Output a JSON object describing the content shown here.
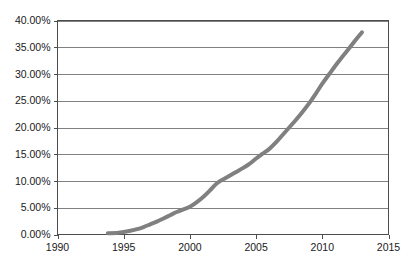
{
  "chart_data": {
    "type": "line",
    "title": "",
    "subtitle": "",
    "xlabel": "",
    "ylabel": "",
    "xlim": [
      1990,
      2015
    ],
    "ylim": [
      0,
      40
    ],
    "grid": "horizontal",
    "legend": "none",
    "line_color": "#808080",
    "axis_color": "#4d4d4d",
    "gridline_color": "#808080",
    "background_color": "#ffffff",
    "x_ticks": [
      1990,
      1995,
      2000,
      2005,
      2010,
      2015
    ],
    "x_tick_labels": [
      "1990",
      "1995",
      "2000",
      "2005",
      "2010",
      "2015"
    ],
    "y_ticks": [
      0,
      5,
      10,
      15,
      20,
      25,
      30,
      35,
      40
    ],
    "y_tick_labels": [
      "0.00%",
      "5.00%",
      "10.00%",
      "15.00%",
      "20.00%",
      "25.00%",
      "30.00%",
      "35.00%",
      "40.00%"
    ],
    "series": [
      {
        "name": "series-1",
        "color": "#808080",
        "x": [
          1993.8,
          1994.5,
          1995,
          1995.5,
          1996,
          1996.5,
          1997,
          1997.5,
          1998,
          1998.5,
          1999,
          1999.5,
          2000,
          2000.5,
          2001,
          2001.5,
          2002,
          2002.5,
          2003,
          2003.5,
          2004,
          2004.5,
          2005,
          2005.5,
          2006,
          2006.5,
          2007,
          2007.5,
          2008,
          2008.5,
          2009,
          2009.5,
          2010,
          2010.5,
          2011,
          2011.5,
          2012,
          2012.5,
          2013
        ],
        "y": [
          0.25,
          0.3,
          0.45,
          0.7,
          1.0,
          1.4,
          1.9,
          2.4,
          3.0,
          3.6,
          4.2,
          4.7,
          5.2,
          6.0,
          7.0,
          8.2,
          9.5,
          10.3,
          11.0,
          11.7,
          12.4,
          13.2,
          14.2,
          15.1,
          16.0,
          17.2,
          18.6,
          20.0,
          21.4,
          22.9,
          24.5,
          26.3,
          28.2,
          29.9,
          31.6,
          33.2,
          34.7,
          36.3,
          37.8
        ]
      }
    ]
  },
  "axis": {
    "y_label_suffix": "%"
  }
}
